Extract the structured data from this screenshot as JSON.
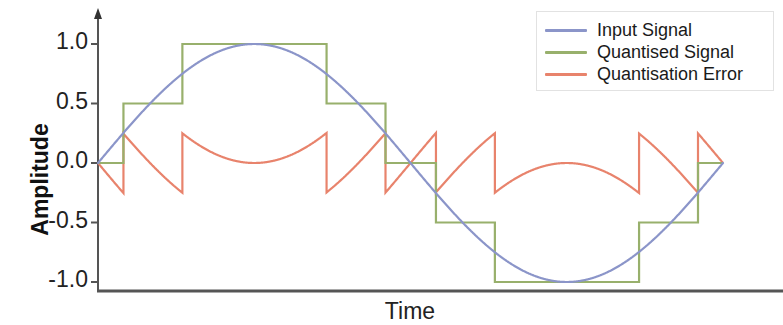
{
  "chart_data": {
    "type": "line",
    "title": "",
    "xlabel": "Time",
    "ylabel": "Amplitude",
    "xlim": [
      0,
      1
    ],
    "ylim": [
      -1.15,
      1.15
    ],
    "grid": false,
    "legend_position": "top-right",
    "y_ticks": [
      {
        "value": 1.0,
        "label": "1.0"
      },
      {
        "value": 0.5,
        "label": "0.5"
      },
      {
        "value": 0.0,
        "label": "0.0"
      },
      {
        "value": -0.5,
        "label": "-0.5"
      },
      {
        "value": -1.0,
        "label": "-1.0"
      }
    ],
    "x_ticks": [],
    "quantiser": {
      "step": 0.5,
      "levels": [
        -1.0,
        -0.5,
        0.0,
        0.5,
        1.0
      ],
      "max_error": 0.25
    },
    "series": [
      {
        "name": "Input Signal",
        "color": "#8b95c9",
        "type": "sine",
        "equation": "sin(2*pi*x)",
        "amplitude": 1.0,
        "cycles": 1,
        "x": [
          0.0,
          0.05,
          0.1,
          0.15,
          0.2,
          0.25,
          0.3,
          0.35,
          0.4,
          0.45,
          0.5,
          0.55,
          0.6,
          0.65,
          0.7,
          0.75,
          0.8,
          0.85,
          0.9,
          0.95,
          1.0
        ],
        "values": [
          0.0,
          0.309,
          0.588,
          0.809,
          0.951,
          1.0,
          0.951,
          0.809,
          0.588,
          0.309,
          0.0,
          -0.309,
          -0.588,
          -0.809,
          -0.951,
          -1.0,
          -0.951,
          -0.809,
          -0.588,
          -0.309,
          0.0
        ]
      },
      {
        "name": "Quantised Signal",
        "color": "#98b06c",
        "type": "step",
        "x": [
          0.0,
          0.05,
          0.1,
          0.15,
          0.2,
          0.25,
          0.3,
          0.35,
          0.4,
          0.45,
          0.5,
          0.55,
          0.6,
          0.65,
          0.7,
          0.75,
          0.8,
          0.85,
          0.9,
          0.95,
          1.0
        ],
        "values": [
          0.0,
          0.5,
          0.5,
          1.0,
          1.0,
          1.0,
          1.0,
          1.0,
          0.5,
          0.5,
          0.0,
          -0.5,
          -0.5,
          -1.0,
          -1.0,
          -1.0,
          -1.0,
          -1.0,
          -0.5,
          -0.5,
          0.0
        ]
      },
      {
        "name": "Quantisation Error",
        "color": "#e8836c",
        "type": "sawtooth",
        "description": "quantised minus input, resets at each quantiser level transition",
        "x": [
          0.0,
          0.05,
          0.1,
          0.15,
          0.2,
          0.25,
          0.3,
          0.35,
          0.4,
          0.45,
          0.5,
          0.55,
          0.6,
          0.65,
          0.7,
          0.75,
          0.8,
          0.85,
          0.9,
          0.95,
          1.0
        ],
        "values": [
          0.0,
          0.191,
          -0.088,
          0.191,
          0.049,
          0.0,
          0.049,
          0.191,
          -0.088,
          0.191,
          0.0,
          -0.191,
          0.088,
          -0.191,
          -0.049,
          0.0,
          -0.049,
          -0.191,
          0.088,
          -0.191,
          0.0
        ]
      }
    ],
    "legend": [
      {
        "label": "Input Signal",
        "color": "#8b95c9"
      },
      {
        "label": "Quantised Signal",
        "color": "#98b06c"
      },
      {
        "label": "Quantisation Error",
        "color": "#e8836c"
      }
    ]
  },
  "axes": {
    "y_label": "Amplitude",
    "x_label": "Time",
    "y_tick_labels": [
      "1.0",
      "0.5",
      "0.0",
      "-0.5",
      "-1.0"
    ]
  }
}
